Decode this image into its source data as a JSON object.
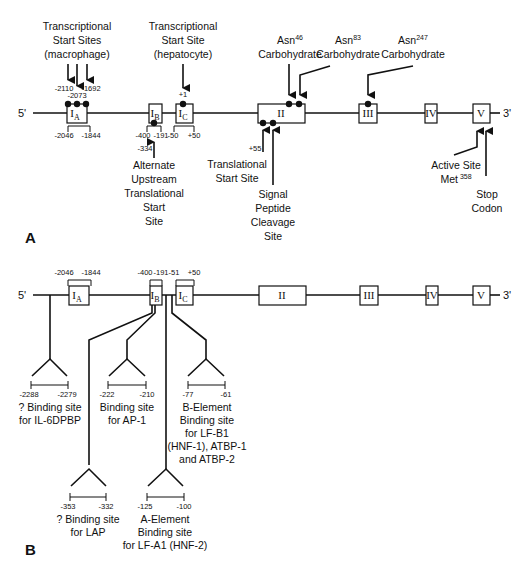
{
  "panel_a": {
    "label": "A",
    "five_prime": "5'",
    "three_prime": "3'",
    "exons": [
      "I",
      "I",
      "I",
      "II",
      "III",
      "IV",
      "V"
    ],
    "exon_subscripts": [
      "A",
      "B",
      "C"
    ],
    "annotations": {
      "tss_macrophage": [
        "Transcriptional",
        "Start Sites",
        "(macrophage)"
      ],
      "tss_hepatocyte": [
        "Transcriptional",
        "Start Site",
        "(hepatocyte)"
      ],
      "asn46": [
        "Asn",
        "46",
        "Carbohydrate"
      ],
      "asn83": [
        "Asn",
        "83",
        "Carbohydrate"
      ],
      "asn247": [
        "Asn",
        "247",
        "Carbohydrate"
      ],
      "alt_upstream": [
        "Alternate",
        "Upstream",
        "Translational",
        "Start",
        "Site"
      ],
      "translational_start": [
        "Translational",
        "Start Site"
      ],
      "signal_peptide": [
        "Signal",
        "Peptide",
        "Cleavage",
        "Site"
      ],
      "active_site": [
        "Active Site",
        "Met",
        "358"
      ],
      "stop_codon": [
        "Stop",
        "Codon"
      ]
    },
    "positions": {
      "p2110": "-2110",
      "p2073": "-2073",
      "p1692": "-1692",
      "p2046": "-2046",
      "p1844": "-1844",
      "p400": "-400",
      "p191": "-191",
      "p50m": "-50",
      "p50p": "+50",
      "p1": "+1",
      "p334": "-334",
      "p55": "+55"
    }
  },
  "panel_b": {
    "label": "B",
    "five_prime": "5'",
    "three_prime": "3'",
    "positions": {
      "p2046": "-2046",
      "p1844": "-1844",
      "p400": "-400",
      "p191": "-191",
      "p51": "-51",
      "p50": "+50"
    },
    "binding_sites": [
      {
        "range": [
          "-2288",
          "-2279"
        ],
        "text": [
          "? Binding site",
          "for IL-6DPBP"
        ]
      },
      {
        "range": [
          "-222",
          "-210"
        ],
        "text": [
          "Binding site",
          "for AP-1"
        ]
      },
      {
        "range": [
          "-77",
          "-61"
        ],
        "text": [
          "B-Element",
          "Binding site",
          "for LF-B1",
          "(HNF-1), ATBP-1",
          "and ATBP-2"
        ]
      },
      {
        "range": [
          "-353",
          "-332"
        ],
        "text": [
          "? Binding site",
          "for LAP"
        ]
      },
      {
        "range": [
          "-125",
          "-100"
        ],
        "text": [
          "A-Element",
          "Binding site",
          "for LF-A1 (HNF-2)"
        ]
      }
    ]
  }
}
